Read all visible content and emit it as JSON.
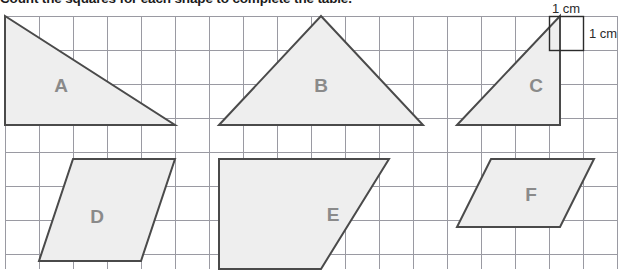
{
  "title": "Count the squares for each shape to complete the table.",
  "grid": {
    "cell_size_px": 34,
    "origin_x": 5,
    "origin_y": 16,
    "cols": 18,
    "rows": 8,
    "line_color": "#9a9aa2",
    "background_color": "#ffffff"
  },
  "scale_reference": {
    "horizontal_label": "1 cm",
    "vertical_label": "1 cm",
    "box_x": 549,
    "box_y": 16,
    "box_size": 34,
    "color": "#2b2b2b"
  },
  "style": {
    "shape_fill": "#eeeeee",
    "shape_stroke": "#4a4a4a",
    "label_color": "#8a8a8a"
  },
  "shapes": [
    {
      "id": "A",
      "label": "A",
      "type": "right-triangle",
      "points": "5,16 5,125 175,125",
      "label_x": 61,
      "label_y": 87
    },
    {
      "id": "B",
      "label": "B",
      "type": "isosceles-triangle",
      "points": "219,125 321,16 423,125",
      "label_x": 321,
      "label_y": 87
    },
    {
      "id": "C",
      "label": "C",
      "type": "right-triangle",
      "points": "457,125 560,16 560,125",
      "label_x": 536,
      "label_y": 87
    },
    {
      "id": "D",
      "label": "D",
      "type": "parallelogram",
      "points": "73,159 175,159 141,261 39,261",
      "label_x": 97,
      "label_y": 218
    },
    {
      "id": "E",
      "label": "E",
      "type": "parallelogram",
      "points": "219,159 389,159 321,269 219,269",
      "label_x": 333,
      "label_y": 216
    },
    {
      "id": "F",
      "label": "F",
      "type": "parallelogram",
      "points": "491,159 594,159 560,227 457,227",
      "label_x": 531,
      "label_y": 196
    }
  ]
}
